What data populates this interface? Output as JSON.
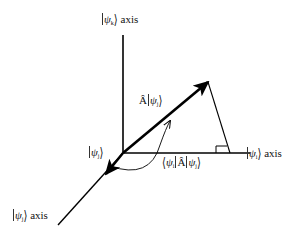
{
  "diagram": {
    "type": "vector-projection-3d-axes",
    "labels": {
      "psi_k_axis": {
        "sym": "ψ",
        "sub": "k",
        "suffix": " axis"
      },
      "psi_i_axis": {
        "sym": "ψ",
        "sub": "i",
        "suffix": " axis"
      },
      "psi_j_axis": {
        "sym": "ψ",
        "sub": "j",
        "suffix": " axis"
      },
      "psi_j_near_origin": {
        "sym": "ψ",
        "sub": "j"
      },
      "A_psi_j": {
        "op": "Â",
        "sym": "ψ",
        "sub": "j"
      },
      "projection": {
        "bra_sym": "ψ",
        "bra_sub": "i",
        "op": "Â",
        "ket_sym": "ψ",
        "ket_sub": "j"
      }
    },
    "geometry": {
      "origin": [
        123,
        153
      ],
      "k_axis_end": [
        123,
        35
      ],
      "i_axis_end": [
        250,
        153
      ],
      "j_axis_end": [
        58,
        225
      ],
      "j_arrow_tip": [
        106,
        174
      ],
      "A_psi_j_tip": [
        208,
        82
      ],
      "perp_foot": [
        230,
        153
      ],
      "stroke_color": "#000000"
    }
  }
}
